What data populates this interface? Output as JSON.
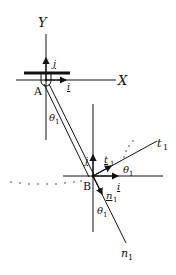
{
  "diagram": {
    "axes": {
      "x_label": "X",
      "y_label": "Y"
    },
    "points": {
      "pivot": "A",
      "end": "B"
    },
    "unit_vectors": {
      "i": "i",
      "j": "j",
      "t": "t",
      "n": "n"
    },
    "subscript": "1",
    "angle": "θ",
    "angle_subscript": "1",
    "lines": {
      "tangent": "t",
      "normal": "n"
    },
    "colors": {
      "stroke": "#111111",
      "background": "#ffffff"
    }
  }
}
